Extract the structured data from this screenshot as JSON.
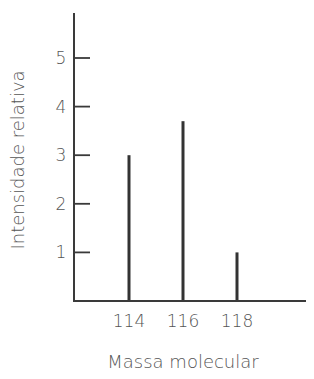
{
  "chart_data": {
    "type": "bar",
    "subtype": "stick spectrum (mass spectrum)",
    "title": "",
    "xlabel": "Massa molecular",
    "ylabel": "Intensidade relativa",
    "categories": [
      "114",
      "116",
      "118"
    ],
    "x": [
      114,
      116,
      118
    ],
    "values": [
      3.0,
      3.7,
      1.0
    ],
    "ylim": [
      0,
      6
    ],
    "y_ticks": [
      1,
      2,
      3,
      4,
      5
    ],
    "x_ticks": [
      114,
      116,
      118
    ],
    "grid": false,
    "legend": null
  },
  "labels": {
    "x_axis_title": "Massa molecular",
    "y_axis_title": "Intensidade relativa",
    "x_ticks": [
      "114",
      "116",
      "118"
    ],
    "y_ticks": [
      "1",
      "2",
      "3",
      "4",
      "5"
    ]
  },
  "colors": {
    "axis": "#3a3a3a",
    "bars": "#333333",
    "text": "#555555"
  }
}
